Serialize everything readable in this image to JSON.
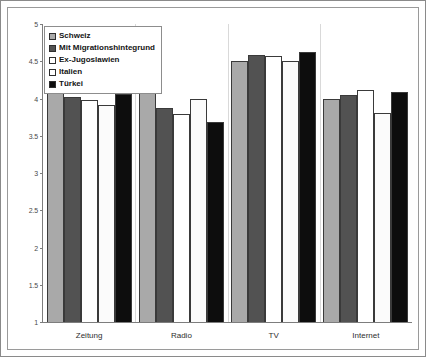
{
  "chart_data": {
    "type": "bar",
    "title": "",
    "subtitle": "",
    "xlabel": "",
    "ylabel": "",
    "ylim": [
      1,
      5
    ],
    "ytick_labels": [
      "5",
      "4.5",
      "4",
      "3.5",
      "3",
      "2.5",
      "2",
      "1.5",
      "1"
    ],
    "ytick_values": [
      5,
      4.5,
      4,
      3.5,
      3,
      2.5,
      2,
      1.5,
      1
    ],
    "grid": false,
    "legend_position": "top-left",
    "categories": [
      "Zeitung",
      "Radio",
      "TV",
      "Internet"
    ],
    "series": [
      {
        "name": "Schweiz",
        "color": "#a9a9a9",
        "values": [
          4.12,
          4.28,
          4.5,
          4.0
        ]
      },
      {
        "name": "Mit Migrationshintegrund",
        "color": "#525252",
        "values": [
          4.02,
          3.87,
          4.58,
          4.05
        ]
      },
      {
        "name": "Ex-Jugoslawien",
        "color": "#ffffff",
        "values": [
          3.98,
          3.79,
          4.57,
          4.11
        ]
      },
      {
        "name": "Italien",
        "color": "#ffffff",
        "values": [
          3.91,
          4.0,
          4.51,
          3.8
        ]
      },
      {
        "name": "Türkei",
        "color": "#0d0d0d",
        "values": [
          4.06,
          3.69,
          4.62,
          4.09
        ]
      }
    ]
  }
}
